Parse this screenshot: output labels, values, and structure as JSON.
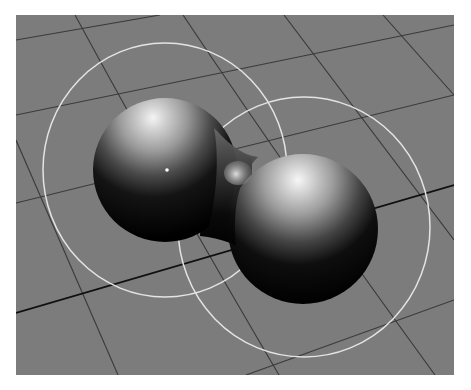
{
  "scene": {
    "title": "3D viewport — two blended metaball spheres over ground grid",
    "background_color": "#7c7c7c",
    "page_background": "#ffffff",
    "grid_line_color": "#3a3a3a",
    "main_axis_line_color": "#101010",
    "influence_ring_color": "#e4e4e4",
    "objects": [
      {
        "name": "Metaball left",
        "type": "metaball-sphere",
        "center_marker": true
      },
      {
        "name": "Metaball right",
        "type": "metaball-sphere",
        "center_marker": false
      }
    ],
    "influence_rings": [
      {
        "name": "Left influence radius"
      },
      {
        "name": "Right influence radius"
      }
    ],
    "icons": {
      "center_marker": "object-origin-dot-icon"
    }
  }
}
